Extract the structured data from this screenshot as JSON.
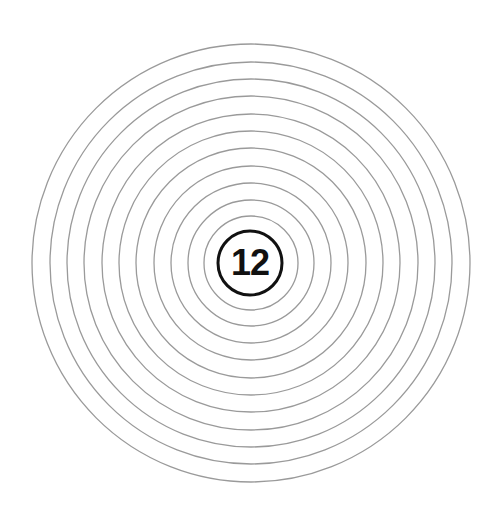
{
  "target": {
    "center_label": "12",
    "ring_count": 11,
    "ring_color": "#9a9a9a",
    "center_ring_color": "#111111",
    "background": "#ffffff"
  }
}
